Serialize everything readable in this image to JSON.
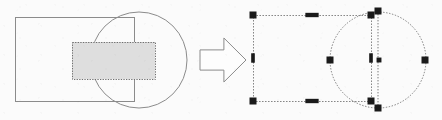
{
  "figure": {
    "background_color": "#fbfbfb",
    "width": 442,
    "height": 120,
    "left_panel": {
      "label": "Original shapes with overlap region highlighted",
      "rectangle": {
        "label": "rectangle-outline",
        "x": 15,
        "y": 17,
        "width": 119,
        "height": 84,
        "stroke_color": "#8b8b8b",
        "stroke_width": 1,
        "fill": "none"
      },
      "circle": {
        "label": "circle-outline",
        "cx": 139,
        "cy": 60,
        "r": 48,
        "stroke_color": "#8b8b8b",
        "stroke_width": 1,
        "fill": "none"
      },
      "highlight_region": {
        "label": "shaded-overlap-region",
        "x": 72,
        "y": 42,
        "width": 83,
        "height": 37,
        "fill_color": "#dedede",
        "stroke_color": "#6e6e6e",
        "stroke_width": 1,
        "stroke_style": "dotted"
      }
    },
    "arrow": {
      "label": "transformation-arrow",
      "direction": "right",
      "x": 200,
      "y": 38,
      "width": 46,
      "height": 44,
      "stroke_color": "#8b8b8b",
      "fill_color": "#fdfdfd",
      "stroke_width": 1
    },
    "right_panel": {
      "label": "Both shapes selected with resize handles",
      "selection_stroke_color": "#7a7a7a",
      "handle_color": "#1a1a1a",
      "handle_size": 7,
      "rectangle": {
        "label": "selected-rectangle",
        "x": 253,
        "y": 15,
        "width": 118,
        "height": 86,
        "stroke_style": "dotted",
        "handles": [
          {
            "name": "handle-top-left",
            "x": 253,
            "y": 15,
            "shape": "square"
          },
          {
            "name": "handle-top-center",
            "x": 312,
            "y": 15,
            "shape": "wide"
          },
          {
            "name": "handle-top-right",
            "x": 371,
            "y": 15,
            "shape": "square"
          },
          {
            "name": "handle-middle-left",
            "x": 253,
            "y": 58,
            "shape": "tall"
          },
          {
            "name": "handle-middle-right",
            "x": 371,
            "y": 58,
            "shape": "tall"
          },
          {
            "name": "handle-bottom-left",
            "x": 253,
            "y": 101,
            "shape": "square"
          },
          {
            "name": "handle-bottom-center",
            "x": 312,
            "y": 101,
            "shape": "wide"
          },
          {
            "name": "handle-bottom-right",
            "x": 371,
            "y": 101,
            "shape": "square"
          }
        ]
      },
      "circle": {
        "label": "selected-circle",
        "cx": 378,
        "cy": 60,
        "r": 48,
        "stroke_style": "dotted",
        "handles": [
          {
            "name": "handle-top",
            "x": 378,
            "y": 11,
            "shape": "square"
          },
          {
            "name": "handle-left",
            "x": 330,
            "y": 60,
            "shape": "square"
          },
          {
            "name": "handle-center",
            "x": 379,
            "y": 60,
            "shape": "small"
          },
          {
            "name": "handle-right",
            "x": 425,
            "y": 60,
            "shape": "square"
          },
          {
            "name": "handle-bottom",
            "x": 378,
            "y": 108,
            "shape": "square"
          }
        ]
      }
    }
  }
}
